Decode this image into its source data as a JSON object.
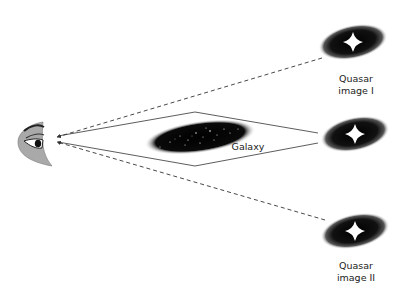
{
  "labels": {
    "quasar_image_1_line1": "Quasar",
    "quasar_image_1_line2": "image I",
    "quasar_image_2_line1": "Quasar",
    "quasar_image_2_line2": "image II",
    "galaxy": "Galaxy"
  },
  "elements": {
    "observer": "eye-icon",
    "quasar_top": "quasar-image-1",
    "quasar_middle": "quasar-source",
    "quasar_bottom": "quasar-image-2",
    "lens": "galaxy"
  },
  "colors": {
    "eye_fill": "#a9a9a9",
    "line": "#333333",
    "quasar": "#000000",
    "star": "#ffffff"
  }
}
